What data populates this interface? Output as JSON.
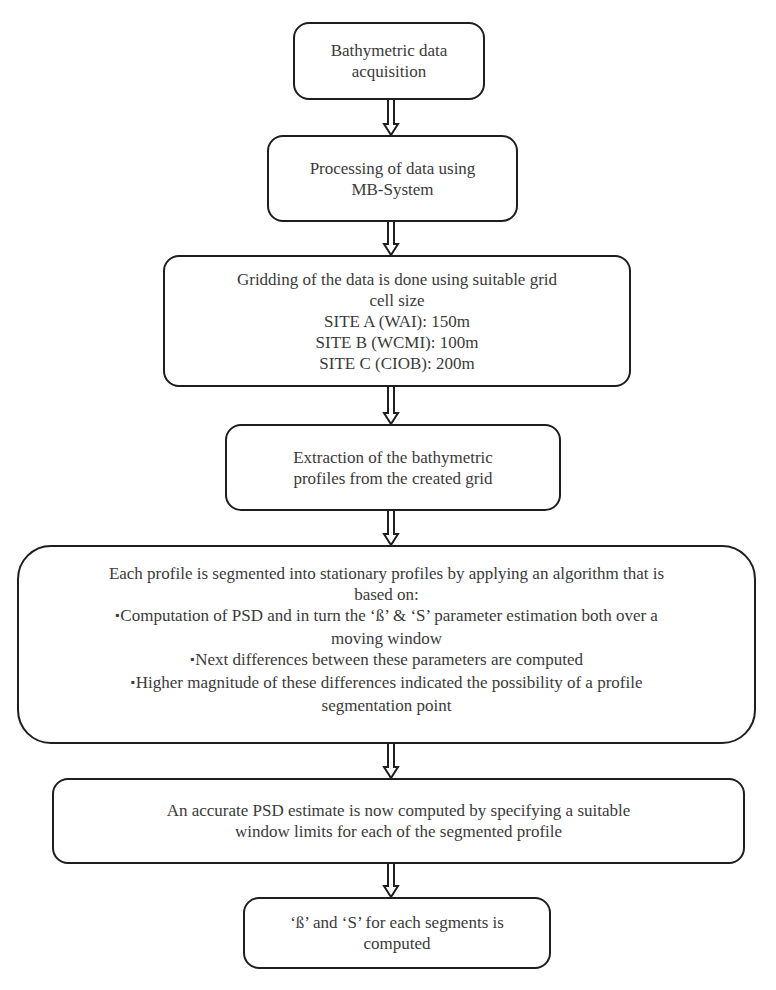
{
  "flowchart": {
    "steps": [
      {
        "id": "step1",
        "lines": [
          "Bathymetric data",
          "acquisition"
        ]
      },
      {
        "id": "step2",
        "lines": [
          "Processing of data using",
          "MB-System"
        ]
      },
      {
        "id": "step3",
        "lines": [
          "Gridding of the data is done using suitable grid",
          "cell size",
          "SITE A (WAI): 150m",
          "SITE B (WCMI): 100m",
          "SITE C (CIOB): 200m"
        ]
      },
      {
        "id": "step4",
        "lines": [
          "Extraction of the bathymetric",
          "profiles from the created grid"
        ]
      },
      {
        "id": "step5",
        "lines": [
          "Each profile is segmented into stationary profiles by applying an algorithm that is",
          "based on:",
          "Computation of PSD and in turn the ‘ß’ & ‘S’ parameter estimation both over a",
          "moving window",
          "Next differences between these parameters are computed",
          "Higher magnitude of these differences indicated the possibility of a profile",
          "segmentation point"
        ],
        "bulleted_lines": [
          2,
          4,
          5
        ]
      },
      {
        "id": "step6",
        "lines": [
          "An accurate PSD estimate is now computed by specifying a suitable",
          "window limits for each of the segmented profile"
        ]
      },
      {
        "id": "step7",
        "lines": [
          "‘ß’ and ‘S’ for each segments is",
          "computed"
        ]
      }
    ],
    "connector": "double-line-down-arrow",
    "colors": {
      "border": "#1e1e1e",
      "text": "#3a3a3a",
      "background": "#ffffff"
    }
  }
}
